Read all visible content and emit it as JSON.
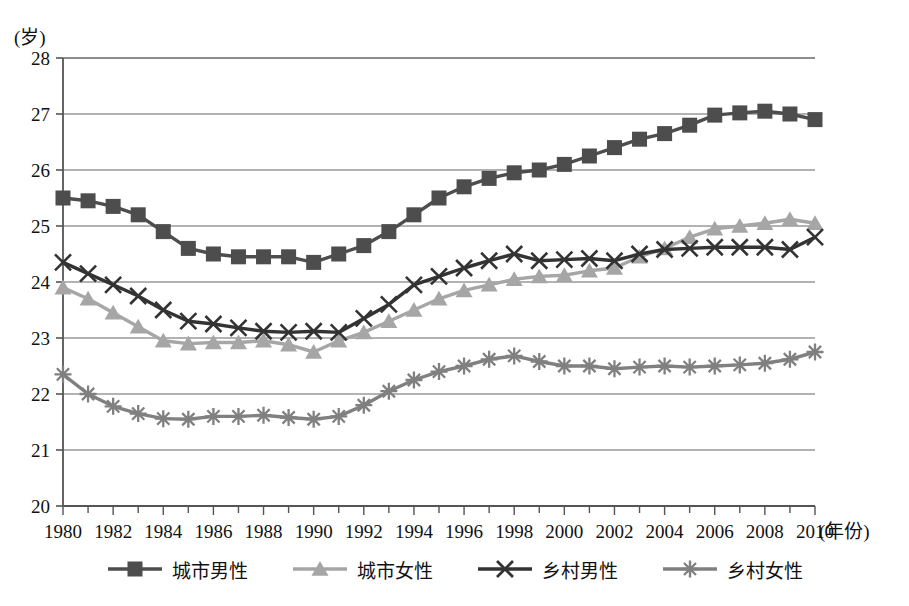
{
  "axis": {
    "y_unit_label": "(岁)",
    "x_title": "(年份)",
    "y_ticks": [
      "28",
      "27",
      "26",
      "25",
      "24",
      "23",
      "22",
      "21",
      "20"
    ],
    "x_ticks": [
      "1980",
      "1982",
      "1984",
      "1986",
      "1988",
      "1990",
      "1992",
      "1994",
      "1996",
      "1998",
      "2000",
      "2002",
      "2004",
      "2006",
      "2008",
      "2010"
    ]
  },
  "colors": {
    "urban_male": "#4d4d4d",
    "urban_female": "#a6a6a6",
    "rural_male": "#333333",
    "rural_female": "#808080",
    "axis": "#555555",
    "grid": "#666666"
  },
  "legend": {
    "items": [
      {
        "label": "城市男性",
        "marker": "square",
        "color": "#4d4d4d"
      },
      {
        "label": "城市女性",
        "marker": "triangle",
        "color": "#a6a6a6"
      },
      {
        "label": "乡村男性",
        "marker": "cross",
        "color": "#333333"
      },
      {
        "label": "乡村女性",
        "marker": "asterisk",
        "color": "#808080"
      }
    ]
  },
  "chart_data": {
    "type": "line",
    "title": "",
    "xlabel": "(年份)",
    "ylabel": "(岁)",
    "xlim": [
      1980,
      2010
    ],
    "ylim": [
      20,
      28
    ],
    "grid": true,
    "legend_position": "bottom",
    "x": [
      1980,
      1981,
      1982,
      1983,
      1984,
      1985,
      1986,
      1987,
      1988,
      1989,
      1990,
      1991,
      1992,
      1993,
      1994,
      1995,
      1996,
      1997,
      1998,
      1999,
      2000,
      2001,
      2002,
      2003,
      2004,
      2005,
      2006,
      2007,
      2008,
      2009,
      2010
    ],
    "series": [
      {
        "name": "城市男性",
        "marker": "square",
        "color": "#4d4d4d",
        "values": [
          25.5,
          25.45,
          25.35,
          25.2,
          24.9,
          24.6,
          24.5,
          24.45,
          24.45,
          24.45,
          24.35,
          24.5,
          24.65,
          24.9,
          25.2,
          25.5,
          25.7,
          25.85,
          25.95,
          26.0,
          26.1,
          26.25,
          26.4,
          26.55,
          26.65,
          26.8,
          26.98,
          27.02,
          27.05,
          27.0,
          26.9
        ]
      },
      {
        "name": "城市女性",
        "marker": "triangle",
        "color": "#a6a6a6",
        "values": [
          23.9,
          23.7,
          23.45,
          23.2,
          22.95,
          22.9,
          22.92,
          22.92,
          22.95,
          22.88,
          22.75,
          22.95,
          23.1,
          23.3,
          23.5,
          23.7,
          23.85,
          23.95,
          24.05,
          24.1,
          24.12,
          24.2,
          24.25,
          24.45,
          24.6,
          24.8,
          24.95,
          25.0,
          25.05,
          25.12,
          25.05
        ]
      },
      {
        "name": "乡村男性",
        "marker": "cross",
        "color": "#333333",
        "values": [
          24.35,
          24.15,
          23.95,
          23.75,
          23.5,
          23.3,
          23.25,
          23.18,
          23.12,
          23.1,
          23.12,
          23.1,
          23.35,
          23.6,
          23.95,
          24.1,
          24.25,
          24.38,
          24.5,
          24.38,
          24.4,
          24.42,
          24.38,
          24.5,
          24.58,
          24.6,
          24.62,
          24.62,
          24.62,
          24.58,
          24.8
        ]
      },
      {
        "name": "乡村女性",
        "marker": "asterisk",
        "color": "#808080",
        "values": [
          22.35,
          22.0,
          21.78,
          21.65,
          21.56,
          21.55,
          21.6,
          21.6,
          21.62,
          21.58,
          21.55,
          21.6,
          21.8,
          22.05,
          22.25,
          22.4,
          22.5,
          22.62,
          22.68,
          22.58,
          22.5,
          22.5,
          22.45,
          22.48,
          22.5,
          22.48,
          22.5,
          22.52,
          22.55,
          22.62,
          22.75
        ]
      }
    ]
  }
}
